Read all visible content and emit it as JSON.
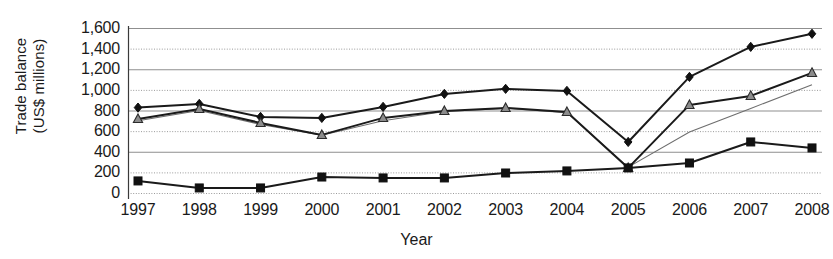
{
  "chart_data": {
    "type": "line",
    "title": "",
    "xlabel": "Year",
    "ylabel": "Trade balance\n(US$ millions)",
    "categories": [
      "1997",
      "1998",
      "1999",
      "2000",
      "2001",
      "2002",
      "2003",
      "2004",
      "2005",
      "2006",
      "2007",
      "2008"
    ],
    "ylim": [
      0,
      1600
    ],
    "yticks": [
      0,
      200,
      400,
      600,
      800,
      1000,
      1200,
      1400,
      1600
    ],
    "ytick_labels": [
      "0",
      "200",
      "400",
      "600",
      "800",
      "1,000",
      "1,200",
      "1,400",
      "1,600"
    ],
    "grid": true,
    "grid_style": "horizontal alternating solid and dotted",
    "legend": "none",
    "series": [
      {
        "name": "series-diamond",
        "marker": "diamond",
        "color": "#1a1a1a",
        "values": [
          828,
          864,
          738,
          728,
          835,
          961,
          1010,
          990,
          495,
          1126,
          1417,
          1544
        ]
      },
      {
        "name": "series-triangle",
        "marker": "triangle",
        "color": "#1a1a1a",
        "marker_fill": "#8c8c8c",
        "values": [
          718,
          815,
          680,
          563,
          728,
          796,
          825,
          786,
          243,
          854,
          942,
          1165
        ]
      },
      {
        "name": "series-thin-gray",
        "marker": "none",
        "color": "#6e6e6e",
        "values": [
          700,
          800,
          665,
          560,
          700,
          790,
          820,
          780,
          250,
          592,
          820,
          1049
        ]
      },
      {
        "name": "series-square",
        "marker": "square",
        "color": "#1a1a1a",
        "values": [
          117,
          49,
          49,
          155,
          146,
          146,
          194,
          214,
          243,
          291,
          495,
          437
        ]
      }
    ]
  }
}
